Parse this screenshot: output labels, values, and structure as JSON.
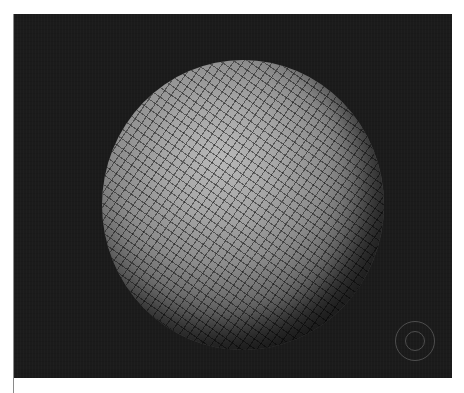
{
  "viewport": {
    "background_color": "#1b1b1b",
    "object": "wireframe-shaded-sphere",
    "sphere_color": "#a6a6a6",
    "navigation_gizmo": "orbit-gizmo-icon"
  },
  "caption": {
    "text": ""
  }
}
